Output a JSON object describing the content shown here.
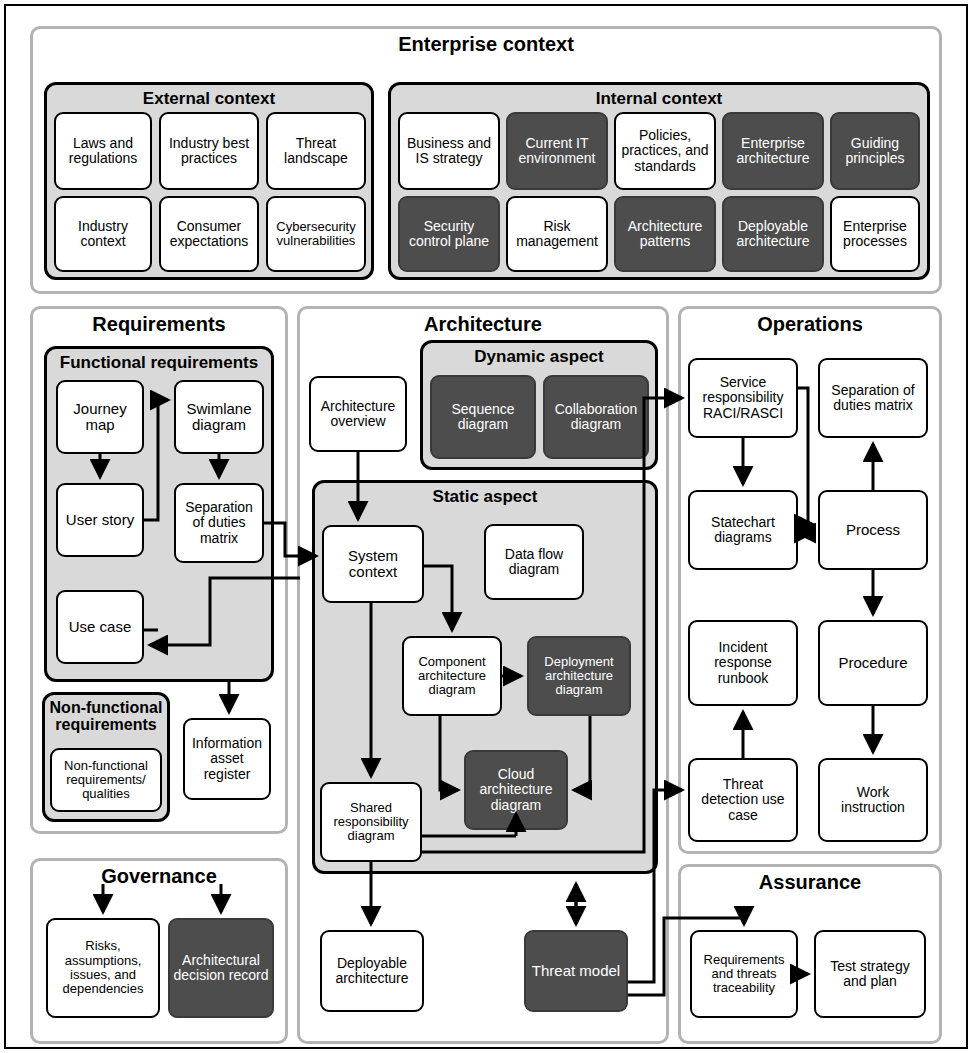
{
  "enterprise_context": {
    "title": "Enterprise context",
    "external": {
      "title": "External context",
      "items": [
        {
          "label": "Laws and regulations",
          "style": "light"
        },
        {
          "label": "Industry best practices",
          "style": "light"
        },
        {
          "label": "Threat landscape",
          "style": "light"
        },
        {
          "label": "Industry context",
          "style": "light"
        },
        {
          "label": "Consumer expectations",
          "style": "light"
        },
        {
          "label": "Cybersecurity vulnerabilities",
          "style": "light"
        }
      ]
    },
    "internal": {
      "title": "Internal context",
      "items": [
        {
          "label": "Business and IS strategy",
          "style": "light"
        },
        {
          "label": "Current IT environment",
          "style": "dark"
        },
        {
          "label": "Policies, practices, and standards",
          "style": "light"
        },
        {
          "label": "Enterprise architecture",
          "style": "dark"
        },
        {
          "label": "Guiding principles",
          "style": "dark"
        },
        {
          "label": "Security control plane",
          "style": "dark"
        },
        {
          "label": "Risk management",
          "style": "light"
        },
        {
          "label": "Architecture patterns",
          "style": "dark"
        },
        {
          "label": "Deployable architecture",
          "style": "dark"
        },
        {
          "label": "Enterprise processes",
          "style": "light"
        }
      ]
    }
  },
  "requirements": {
    "title": "Requirements",
    "functional": {
      "title": "Functional requirements",
      "items": [
        {
          "label": "Journey map",
          "style": "light"
        },
        {
          "label": "Swimlane diagram",
          "style": "light"
        },
        {
          "label": "User story",
          "style": "light"
        },
        {
          "label": "Separation of duties matrix",
          "style": "light"
        },
        {
          "label": "Use case",
          "style": "light"
        }
      ]
    },
    "non_functional": {
      "title": "Non-functional requirements",
      "items": [
        {
          "label": "Non-functional requirements/ qualities",
          "style": "light"
        }
      ]
    },
    "information_asset_register": {
      "label": "Information asset register",
      "style": "light"
    }
  },
  "architecture": {
    "title": "Architecture",
    "overview": {
      "label": "Architecture overview",
      "style": "light"
    },
    "dynamic": {
      "title": "Dynamic aspect",
      "items": [
        {
          "label": "Sequence diagram",
          "style": "dark"
        },
        {
          "label": "Collaboration diagram",
          "style": "dark"
        }
      ]
    },
    "static": {
      "title": "Static aspect",
      "items": [
        {
          "label": "System context",
          "style": "light"
        },
        {
          "label": "Data flow diagram",
          "style": "light"
        },
        {
          "label": "Component architecture diagram",
          "style": "light"
        },
        {
          "label": "Deployment architecture diagram",
          "style": "dark"
        },
        {
          "label": "Cloud architecture diagram",
          "style": "dark"
        },
        {
          "label": "Shared responsibility diagram",
          "style": "light"
        }
      ]
    },
    "deployable_architecture": {
      "label": "Deployable architecture",
      "style": "light"
    },
    "threat_model": {
      "label": "Threat model",
      "style": "dark"
    }
  },
  "operations": {
    "title": "Operations",
    "items": [
      {
        "label": "Service responsibility RACI/RASCI",
        "style": "light"
      },
      {
        "label": "Separation of duties matrix",
        "style": "light"
      },
      {
        "label": "Statechart diagrams",
        "style": "light"
      },
      {
        "label": "Process",
        "style": "light"
      },
      {
        "label": "Incident response runbook",
        "style": "light"
      },
      {
        "label": "Procedure",
        "style": "light"
      },
      {
        "label": "Threat detection use case",
        "style": "light"
      },
      {
        "label": "Work instruction",
        "style": "light"
      }
    ]
  },
  "governance": {
    "title": "Governance",
    "items": [
      {
        "label": "Risks, assumptions, issues, and dependencies",
        "style": "light"
      },
      {
        "label": "Architectural decision record",
        "style": "dark"
      }
    ]
  },
  "assurance": {
    "title": "Assurance",
    "items": [
      {
        "label": "Requirements and threats traceability",
        "style": "light"
      },
      {
        "label": "Test strategy and plan",
        "style": "light"
      }
    ]
  },
  "colors": {
    "dark_fill": "#4d4d4d",
    "light_fill": "#ffffff",
    "group_fill": "#d9d9d9",
    "panel_border": "#b3b3b3",
    "node_border": "#000000"
  }
}
